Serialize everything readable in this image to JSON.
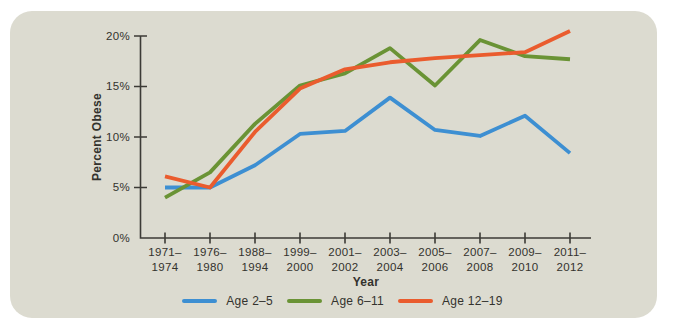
{
  "chart_data": {
    "type": "line",
    "xlabel": "Year",
    "ylabel": "Percent Obese",
    "ylim": [
      0,
      20
    ],
    "grid": false,
    "legend_position": "bottom",
    "background_color": "#dcdbd0",
    "axis_color": "#3c3b36",
    "text_color": "#33322d",
    "ytick_labels": [
      "0%",
      "5%",
      "10%",
      "15%",
      "20%"
    ],
    "ytick_values": [
      0,
      5,
      10,
      15,
      20
    ],
    "categories": [
      {
        "line1": "1971–",
        "line2": "1974"
      },
      {
        "line1": "1976–",
        "line2": "1980"
      },
      {
        "line1": "1988–",
        "line2": "1994"
      },
      {
        "line1": "1999–",
        "line2": "2000"
      },
      {
        "line1": "2001–",
        "line2": "2002"
      },
      {
        "line1": "2003–",
        "line2": "2004"
      },
      {
        "line1": "2005–",
        "line2": "2006"
      },
      {
        "line1": "2007–",
        "line2": "2008"
      },
      {
        "line1": "2009–",
        "line2": "2010"
      },
      {
        "line1": "2011–",
        "line2": "2012"
      }
    ],
    "series": [
      {
        "name": "Age 2–5",
        "color": "#3d8fd2",
        "values": [
          5.0,
          5.0,
          7.2,
          10.3,
          10.6,
          13.9,
          10.7,
          10.1,
          12.1,
          8.4
        ]
      },
      {
        "name": "Age 6–11",
        "color": "#6a9335",
        "values": [
          4.0,
          6.5,
          11.3,
          15.1,
          16.3,
          18.8,
          15.1,
          19.6,
          18.0,
          17.7
        ]
      },
      {
        "name": "Age 12–19",
        "color": "#ea5c2e",
        "values": [
          6.1,
          5.0,
          10.5,
          14.8,
          16.7,
          17.4,
          17.8,
          18.1,
          18.4,
          20.5
        ]
      }
    ]
  }
}
